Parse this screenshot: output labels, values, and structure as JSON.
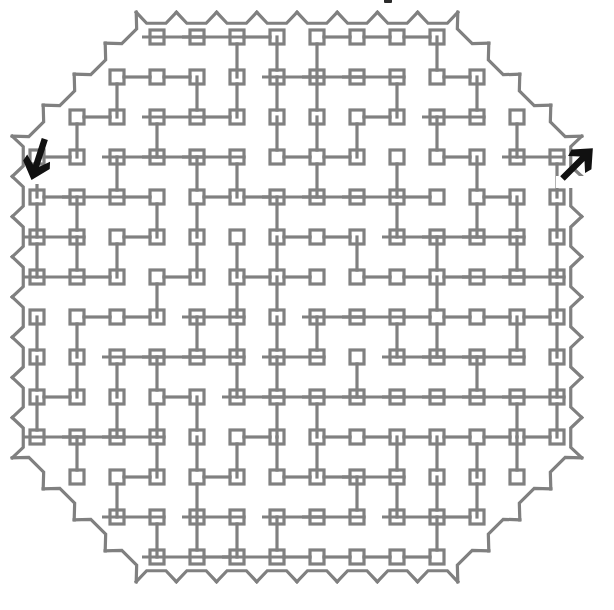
{
  "figure": {
    "kind": "maze-puzzle",
    "shape": "octagon",
    "background_color": "#ffffff",
    "line_color": "#808080",
    "line_width": 3.2,
    "marker_color": "#111111",
    "grid": {
      "cell_size": 40,
      "origin_x": 37,
      "origin_y": 37,
      "cols": 14,
      "rows": 14,
      "node_square_size": 14
    },
    "canvas": {
      "width": 614,
      "height": 610
    }
  },
  "markers": {
    "entrance": {
      "name": "entrance-arrow",
      "label": "entrance",
      "direction": "down",
      "x": 38,
      "y": 160,
      "rotation_deg": 18
    },
    "exit": {
      "name": "exit-arrow",
      "label": "exit",
      "direction": "up-right",
      "x": 578,
      "y": 163,
      "rotation_deg": -45
    }
  },
  "top_mark": {
    "name": "cropped-glyph-mark",
    "visible": true
  }
}
